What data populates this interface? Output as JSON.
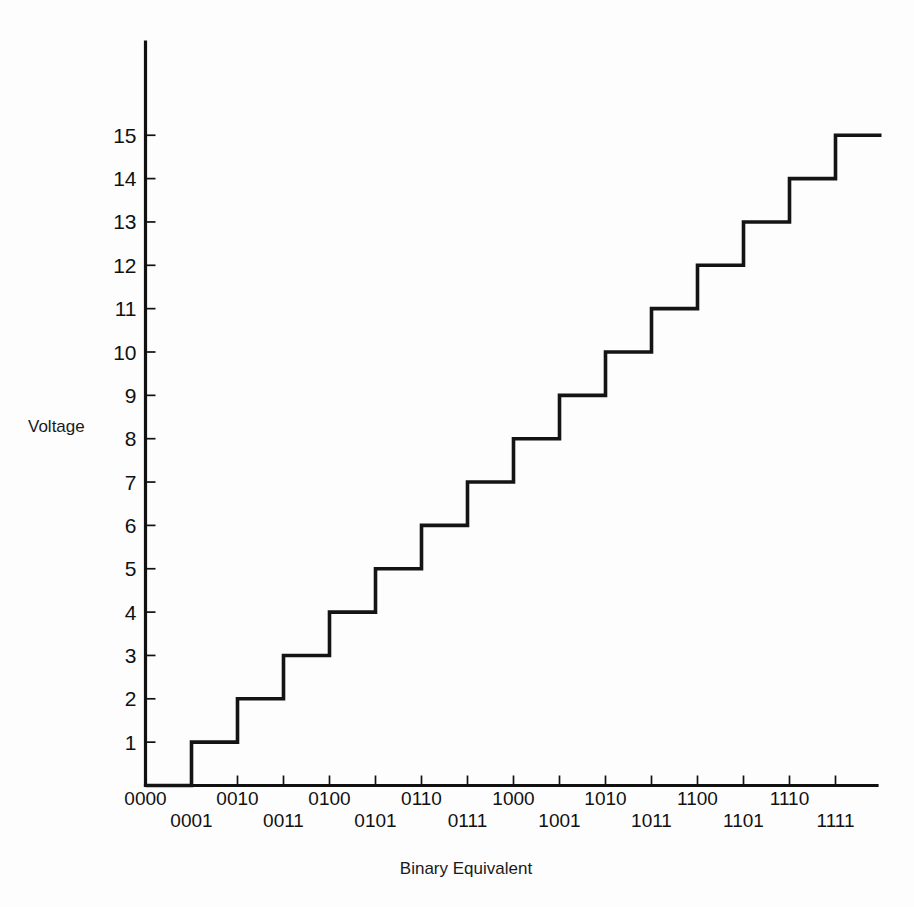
{
  "chart_data": {
    "type": "line",
    "title": "",
    "subtitle": "",
    "xlabel": "Binary Equivalent",
    "ylabel": "Voltage",
    "grid": false,
    "legend": "none",
    "style": "staircase",
    "categories": [
      "0000",
      "0001",
      "0010",
      "0011",
      "0100",
      "0101",
      "0110",
      "0111",
      "1000",
      "1001",
      "1010",
      "1011",
      "1100",
      "1101",
      "1110",
      "1111"
    ],
    "values": [
      0,
      1,
      2,
      3,
      4,
      5,
      6,
      7,
      8,
      9,
      10,
      11,
      12,
      13,
      14,
      15
    ],
    "x": [
      0,
      1,
      2,
      3,
      4,
      5,
      6,
      7,
      8,
      9,
      10,
      11,
      12,
      13,
      14,
      15
    ],
    "xlim": [
      0,
      16
    ],
    "ylim": [
      0,
      15.6
    ],
    "ytick_labels": [
      "1",
      "2",
      "3",
      "4",
      "5",
      "6",
      "7",
      "8",
      "9",
      "10",
      "11",
      "12",
      "13",
      "14",
      "15"
    ],
    "ytick_values": [
      1,
      2,
      3,
      4,
      5,
      6,
      7,
      8,
      9,
      10,
      11,
      12,
      13,
      14,
      15
    ],
    "xtick_labels": [
      "0000",
      "0001",
      "0010",
      "0011",
      "0100",
      "0101",
      "0110",
      "0111",
      "1000",
      "1001",
      "1010",
      "1011",
      "1100",
      "1101",
      "1110",
      "1111"
    ],
    "xtick_label_rows": [
      0,
      1,
      0,
      1,
      0,
      1,
      0,
      1,
      0,
      1,
      0,
      1,
      0,
      1,
      0,
      1
    ],
    "line_color": "#141414",
    "axis_color": "#111111",
    "background_color": "#fdfdfd"
  }
}
